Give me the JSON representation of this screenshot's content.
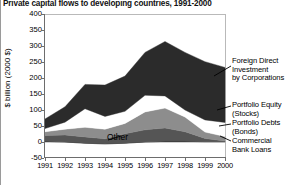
{
  "title": "Private capital flows to developing countries, 1991-2000",
  "axis": {
    "ylabel": "$ billion (2000 $)",
    "yticks": [
      "400",
      "350",
      "300",
      "250",
      "200",
      "150",
      "100",
      "50",
      "0",
      "-50"
    ],
    "xticks": [
      "1991",
      "1992",
      "1993",
      "1994",
      "1995",
      "1996",
      "1997",
      "1998",
      "1999",
      "2000"
    ]
  },
  "annotations": {
    "other": "Other"
  },
  "legend": {
    "items": [
      {
        "label": "Foreign Direct\nInvestment\nby Corporations",
        "color": "#2b2b2b"
      },
      {
        "label": "Portfolio Equity\n(Stocks)",
        "color": "#ffffff"
      },
      {
        "label": "Portfolio Debts\n(Bonds)",
        "color": "#8d8d8d"
      },
      {
        "label": "Commercial\n  Bank Loans",
        "color": "#555555"
      }
    ]
  },
  "chart_data": {
    "type": "area",
    "stacked": true,
    "title": "Private capital flows to developing countries, 1991-2000",
    "xlabel": "",
    "ylabel": "$ billion (2000 $)",
    "ylim": [
      -50,
      400
    ],
    "xlim": [
      1991,
      2000
    ],
    "grid": false,
    "legend_position": "right",
    "categories": [
      "1991",
      "1992",
      "1993",
      "1994",
      "1995",
      "1996",
      "1997",
      "1998",
      "1999",
      "2000"
    ],
    "x": [
      1991,
      1992,
      1993,
      1994,
      1995,
      1996,
      1997,
      1998,
      1999,
      2000
    ],
    "series": [
      {
        "name": "Other",
        "color": "#111111",
        "values": [
          2,
          0,
          -4,
          -6,
          -4,
          0,
          2,
          2,
          1,
          1
        ]
      },
      {
        "name": "Commercial Bank Loans",
        "color": "#555555",
        "values": [
          18,
          22,
          20,
          16,
          30,
          38,
          42,
          30,
          10,
          2
        ]
      },
      {
        "name": "Portfolio Debts (Bonds)",
        "color": "#8d8d8d",
        "values": [
          12,
          18,
          30,
          30,
          32,
          56,
          62,
          46,
          20,
          14
        ]
      },
      {
        "name": "Portfolio Equity (Stocks)",
        "color": "#ffffff",
        "values": [
          10,
          22,
          58,
          40,
          38,
          52,
          38,
          22,
          38,
          44
        ]
      },
      {
        "name": "Foreign Direct Investment by Corporations",
        "color": "#2b2b2b",
        "values": [
          30,
          48,
          76,
          98,
          110,
          134,
          170,
          180,
          182,
          172
        ]
      }
    ],
    "totals": [
      72,
      110,
      180,
      178,
      206,
      280,
      314,
      280,
      251,
      233
    ]
  }
}
